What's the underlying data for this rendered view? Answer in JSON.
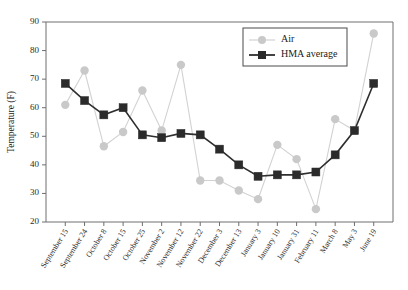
{
  "chart_data": {
    "type": "line",
    "title": "",
    "xlabel": "",
    "ylabel": "Temperature (F)",
    "ylim": [
      20,
      90
    ],
    "ytick_step": 10,
    "yticks": [
      20,
      30,
      40,
      50,
      60,
      70,
      80,
      90
    ],
    "grid": false,
    "legend_position": "top-right",
    "categories": [
      "September 15",
      "September 24",
      "October 8",
      "October 15",
      "October 25",
      "November 2",
      "November 12",
      "November 22",
      "December 3",
      "December 13",
      "January 3",
      "January 10",
      "January 31",
      "February 11",
      "March 8",
      "May 3",
      "June 19"
    ],
    "series": [
      {
        "name": "Air",
        "color": "#c9c9c9",
        "marker": "circle",
        "values": [
          61,
          73,
          46.5,
          51.5,
          66,
          52,
          75,
          34.5,
          34.5,
          31,
          28,
          47,
          42,
          24.5,
          56,
          52,
          86
        ]
      },
      {
        "name": "HMA average",
        "color": "#2b2b2b",
        "marker": "square",
        "values": [
          68.5,
          62.5,
          57.5,
          60,
          50.5,
          49.5,
          51,
          50.5,
          45.5,
          40,
          36,
          36.5,
          36.5,
          37.5,
          43.5,
          52,
          68.5
        ]
      }
    ]
  },
  "legend": {
    "entries": [
      {
        "label": "Air"
      },
      {
        "label": "HMA average"
      }
    ]
  },
  "axes": {
    "y_title": "Temperature (F)"
  }
}
